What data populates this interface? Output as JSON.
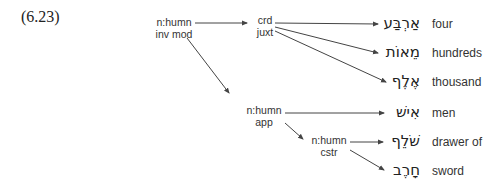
{
  "example_number": "(6.23)",
  "nodes": {
    "root": {
      "line1": "n:humn",
      "line2": "inv mod"
    },
    "crd": {
      "line1": "crd",
      "line2": "juxt"
    },
    "app": {
      "line1": "n:humn",
      "line2": "app"
    },
    "cstr": {
      "line1": "n:humn",
      "line2": "cstr"
    }
  },
  "leaves": [
    {
      "hebrew": "אַרְבַּע",
      "gloss": "four"
    },
    {
      "hebrew": "מֵאוֹת",
      "gloss": "hundreds"
    },
    {
      "hebrew": "אֶלֶף",
      "gloss": "thousand"
    },
    {
      "hebrew": "אִישׁ",
      "gloss": "men"
    },
    {
      "hebrew": "שֹׁלֵף",
      "gloss": "drawer of"
    },
    {
      "hebrew": "חָרֶב",
      "gloss": "sword"
    }
  ],
  "colors": {
    "line": "#444444",
    "text": "#333333"
  }
}
